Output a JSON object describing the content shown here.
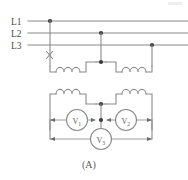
{
  "figure": {
    "caption": "(A)",
    "type": "three-phase-open-delta-transformer-schematic"
  },
  "bus_lines": [
    {
      "id": "L1",
      "label": "L1",
      "y": 21,
      "tap_x": 50
    },
    {
      "id": "L2",
      "label": "L2",
      "y": 33,
      "tap_x": 101
    },
    {
      "id": "L3",
      "label": "L3",
      "y": 45,
      "tap_x": 152
    }
  ],
  "markers": {
    "fault_mark": "×",
    "fault_label": "open-circuit-fault-x-mark",
    "junction_dot": "•"
  },
  "primary": {
    "name": "primary-winding",
    "coils": [
      {
        "id": "coil-primary-left",
        "turns": 3
      },
      {
        "id": "coil-primary-right",
        "turns": 3
      }
    ]
  },
  "secondary": {
    "name": "secondary-winding",
    "coils": [
      {
        "id": "coil-secondary-left",
        "turns": 3
      },
      {
        "id": "coil-secondary-right",
        "turns": 3
      }
    ]
  },
  "meters": [
    {
      "id": "V1",
      "letter": "V",
      "subscript": "1",
      "name": "voltmeter-v1"
    },
    {
      "id": "V2",
      "letter": "V",
      "subscript": "2",
      "name": "voltmeter-v2"
    },
    {
      "id": "V3",
      "letter": "V",
      "subscript": "3",
      "name": "voltmeter-v3"
    }
  ],
  "colors": {
    "wire": "#8a8a8a",
    "dot": "#3a3a3a",
    "text": "#4a4a4a",
    "background": "#ffffff"
  }
}
